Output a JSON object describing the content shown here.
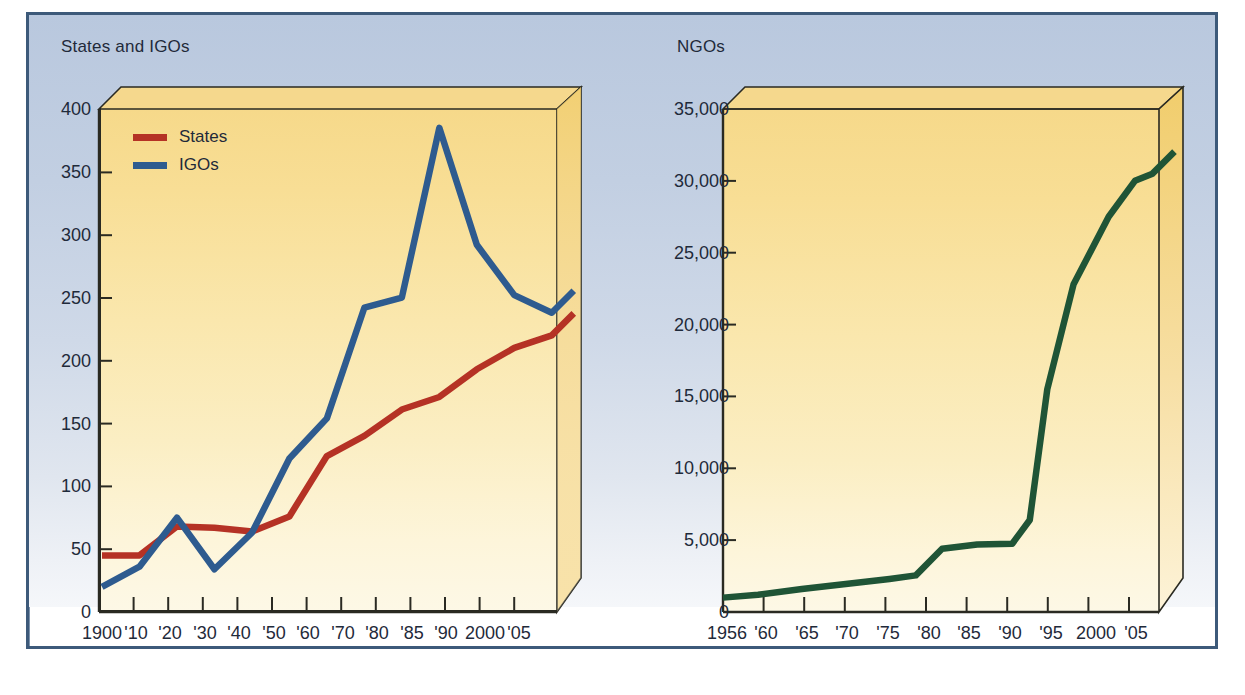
{
  "figure": {
    "background": "#ffffff",
    "frame_color": "#3d5a7a",
    "panel_gradient_top": "#b9c8de",
    "panel_gradient_bottom": "#f5f7fa",
    "plot_fill_top": "#f6d98a",
    "plot_fill_bottom": "#fdf8e6"
  },
  "chart_data": [
    {
      "id": "states-igos",
      "type": "line",
      "title": "States and IGOs",
      "xlabel": "",
      "ylabel": "",
      "ylim": [
        0,
        400
      ],
      "yticks": [
        0,
        50,
        100,
        150,
        200,
        250,
        300,
        350,
        400
      ],
      "ytick_labels": [
        "0",
        "50",
        "100",
        "150",
        "200",
        "250",
        "300",
        "350",
        "400"
      ],
      "categories": [
        "1900",
        "'10",
        "'20",
        "'30",
        "'40",
        "'50",
        "'60",
        "'70",
        "'80",
        "'85",
        "'90",
        "2000",
        "'05"
      ],
      "grid": false,
      "legend_position": "upper-left",
      "series": [
        {
          "name": "States",
          "color": "#b53225",
          "values": [
            45,
            45,
            68,
            67,
            64,
            76,
            124,
            140,
            161,
            171,
            193,
            210,
            220
          ]
        },
        {
          "name": "IGOs",
          "color": "#2e5b8f",
          "values": [
            20,
            36,
            75,
            34,
            63,
            122,
            154,
            242,
            250,
            385,
            292,
            252,
            238
          ]
        }
      ]
    },
    {
      "id": "ngos",
      "type": "line",
      "title": "NGOs",
      "xlabel": "",
      "ylabel": "",
      "ylim": [
        0,
        35000
      ],
      "yticks": [
        0,
        5000,
        10000,
        15000,
        20000,
        25000,
        30000,
        35000
      ],
      "ytick_labels": [
        "0",
        "5,000",
        "10,000",
        "15,000",
        "20,000",
        "25,000",
        "30,000",
        "35,000"
      ],
      "categories": [
        "1956",
        "'60",
        "'65",
        "'70",
        "'75",
        "'80",
        "'85",
        "'90",
        "'95",
        "2000",
        "'05"
      ],
      "grid": false,
      "legend_position": "none",
      "series": [
        {
          "name": "NGOs",
          "color": "#1f5436",
          "x": [
            1956,
            1960,
            1965,
            1970,
            1975,
            1978,
            1981,
            1985,
            1989,
            1991,
            1993,
            1996,
            2000,
            2003,
            2005
          ],
          "values": [
            1000,
            1200,
            1600,
            1950,
            2300,
            2550,
            4400,
            4700,
            4750,
            6400,
            15500,
            22800,
            27500,
            30000,
            30500
          ]
        }
      ]
    }
  ],
  "left_chart": {
    "title": "States and IGOs",
    "legend": [
      {
        "label": "States",
        "color": "#b53225"
      },
      {
        "label": "IGOs",
        "color": "#2e5b8f"
      }
    ]
  },
  "right_chart": {
    "title": "NGOs"
  }
}
